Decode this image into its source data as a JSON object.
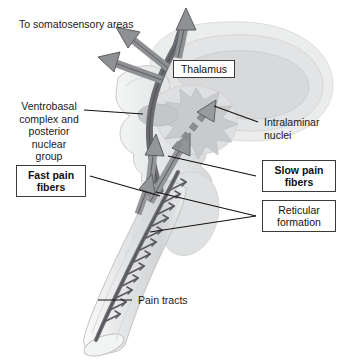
{
  "figure": {
    "background_color": "#ffffff"
  },
  "labels": {
    "to_somatosensory": "To somatosensory areas",
    "thalamus": "Thalamus",
    "ventrobasal": "Ventrobasal\ncomplex and\nposterior\nnuclear\ngroup",
    "intralaminar": "Intralaminar\nnuclei",
    "fast_pain": "Fast pain\nfibers",
    "slow_pain": "Slow pain\nfibers",
    "reticular": "Reticular\nformation",
    "pain_tracts": "Pain tracts"
  },
  "colors": {
    "ink": "#1a1a1a",
    "leader_line": "#111111",
    "box_border": "#3a3a3a",
    "arrow_fill": "#8f9093",
    "arrow_stroke": "#5d5e62",
    "tract_dark": "#6a6b70",
    "tract_core": "#55565b",
    "cerebrum_outer": "#eceded",
    "cerebrum_mid": "#e2e3e4",
    "cerebrum_inner": "#d6d7d9",
    "brainstem_fill": "#e8e9ea",
    "brainstem_stroke": "#c6c7c9",
    "cord_fill": "#e9eaeb",
    "cord_stroke": "#c2c3c5",
    "nuclei_star": "#c9cacc",
    "ventrobasal_oval": "#c4c5c8",
    "cerebellum_fill": "#dcdddf"
  },
  "anatomy": {
    "structures": [
      {
        "name": "cerebrum",
        "kind": "c-shape"
      },
      {
        "name": "thalamus-region",
        "kind": "blob"
      },
      {
        "name": "intralaminar-nuclei-starburst",
        "kind": "starburst"
      },
      {
        "name": "ventrobasal-complex-oval",
        "kind": "ellipse"
      },
      {
        "name": "brainstem",
        "kind": "column"
      },
      {
        "name": "cerebellum",
        "kind": "blob"
      },
      {
        "name": "spinal-cord",
        "kind": "tapered-cylinder"
      },
      {
        "name": "pain-tract-line",
        "kind": "line-with-collaterals"
      }
    ],
    "arrows": [
      {
        "name": "cortical-arrow-up",
        "style": "solid"
      },
      {
        "name": "cortical-arrow-upleft",
        "style": "solid"
      },
      {
        "name": "cortical-arrow-left",
        "style": "solid"
      },
      {
        "name": "fast-pain-arrow-to-ventrobasal",
        "style": "solid"
      },
      {
        "name": "slow-pain-arrow-to-intralaminar",
        "style": "solid"
      },
      {
        "name": "slow-pain-dashed-arrow",
        "style": "dashed"
      },
      {
        "name": "ascending-arrow-left",
        "style": "solid"
      },
      {
        "name": "ascending-arrow-right",
        "style": "solid"
      }
    ]
  }
}
